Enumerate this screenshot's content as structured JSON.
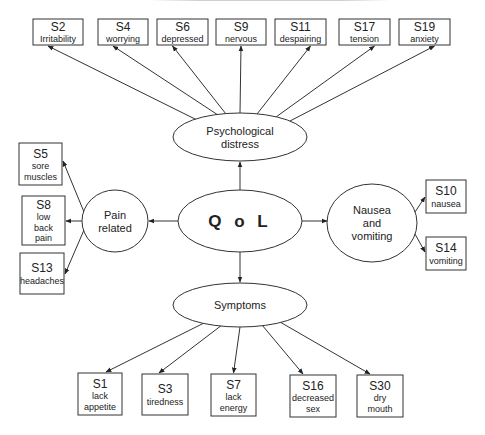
{
  "figure": {
    "header_partial": "",
    "colors": {
      "stroke": "#333333",
      "text": "#222222",
      "background": "#ffffff"
    },
    "center": {
      "id": "qol",
      "label": "Q o L"
    },
    "latent_factors": [
      {
        "id": "psych",
        "label_lines": [
          "Psychological",
          "distress"
        ]
      },
      {
        "id": "pain",
        "label_lines": [
          "Pain",
          "related"
        ]
      },
      {
        "id": "nausea",
        "label_lines": [
          "Nausea",
          "and",
          "vomiting"
        ]
      },
      {
        "id": "symptoms",
        "label_lines": [
          "Symptoms"
        ]
      }
    ],
    "indicators": {
      "psych": [
        {
          "code": "S2",
          "lines": [
            "Irritability"
          ]
        },
        {
          "code": "S4",
          "lines": [
            "worrying"
          ]
        },
        {
          "code": "S6",
          "lines": [
            "depressed"
          ]
        },
        {
          "code": "S9",
          "lines": [
            "nervous"
          ]
        },
        {
          "code": "S11",
          "lines": [
            "despairing"
          ]
        },
        {
          "code": "S17",
          "lines": [
            "tension"
          ]
        },
        {
          "code": "S19",
          "lines": [
            "anxiety"
          ]
        }
      ],
      "pain": [
        {
          "code": "S5",
          "lines": [
            "sore",
            "muscles"
          ]
        },
        {
          "code": "S8",
          "lines": [
            "low",
            "back",
            "pain"
          ]
        },
        {
          "code": "S13",
          "lines": [
            "headaches"
          ]
        }
      ],
      "nausea": [
        {
          "code": "S10",
          "lines": [
            "nausea"
          ]
        },
        {
          "code": "S14",
          "lines": [
            "vomiting"
          ]
        }
      ],
      "symptoms": [
        {
          "code": "S1",
          "lines": [
            "lack",
            "appetite"
          ]
        },
        {
          "code": "S3",
          "lines": [
            "tiredness"
          ]
        },
        {
          "code": "S7",
          "lines": [
            "lack",
            "energy"
          ]
        },
        {
          "code": "S16",
          "lines": [
            "decreased",
            "sex"
          ]
        },
        {
          "code": "S30",
          "lines": [
            "dry",
            "mouth"
          ]
        }
      ]
    }
  }
}
